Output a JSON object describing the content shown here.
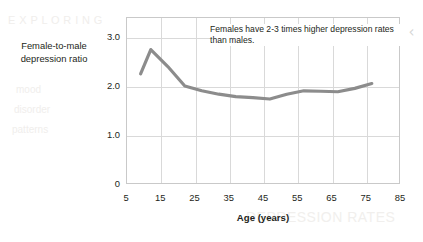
{
  "chart_data": {
    "type": "line",
    "title": "",
    "xlabel": "Age (years)",
    "ylabel": "Female-to-male depression ratio",
    "xlim": [
      5,
      85
    ],
    "ylim": [
      0,
      3.4
    ],
    "grid": true,
    "legend": "none",
    "line_color": "#8c8c8c",
    "x_ticks": [
      "5",
      "15",
      "25",
      "35",
      "45",
      "55",
      "65",
      "75",
      "85"
    ],
    "x_tick_values": [
      5,
      15,
      25,
      35,
      45,
      55,
      65,
      75,
      85
    ],
    "y_ticks": [
      "0",
      "1.0",
      "2.0",
      "3.0"
    ],
    "y_tick_values": [
      0,
      1.0,
      2.0,
      3.0
    ],
    "series": [
      {
        "name": "Female-to-male depression ratio",
        "x": [
          9,
          12,
          17,
          22,
          27,
          32,
          37,
          42,
          47,
          52,
          57,
          62,
          67,
          72,
          77
        ],
        "values": [
          2.25,
          2.75,
          2.4,
          2.0,
          1.9,
          1.83,
          1.78,
          1.76,
          1.73,
          1.83,
          1.9,
          1.89,
          1.88,
          1.95,
          2.05
        ]
      }
    ],
    "annotations": [
      {
        "id": "annotation-note",
        "text": "Females have 2-3 times higher depression rates than males."
      }
    ]
  },
  "axis": {
    "y_title_line1": "Female-to-male",
    "y_title_line2": "depression ratio",
    "x_title": "Age (years)"
  },
  "annotation": {
    "text": "Females have 2-3 times higher depression rates than males."
  },
  "nav": {
    "chevron_left": "‹"
  },
  "ghost_text": {
    "a": "E X P L O R I N G",
    "b": "mood",
    "c": "disorder",
    "d": "patterns",
    "e": "Depression",
    "f": "DEPRESSION RATES"
  },
  "colors": {
    "line": "#8c8c8c",
    "grid": "#d9d9d9",
    "frame": "#c9c9c9",
    "text": "#231f20",
    "chevron": "#d6d6d6"
  }
}
